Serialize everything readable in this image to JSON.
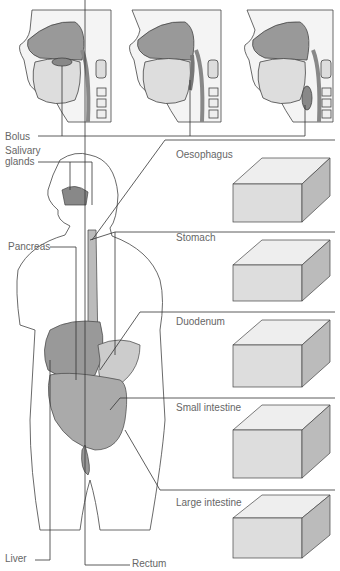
{
  "figure": {
    "top_panels": [
      "swallowing-stage-1",
      "swallowing-stage-2",
      "swallowing-stage-3"
    ],
    "labels": {
      "bolus": "Bolus",
      "salivary_1": "Salivary",
      "salivary_2": "glands",
      "pancreas": "Pancreas",
      "liver": "Liver",
      "rectum": "Rectum",
      "oesophagus": "Oesophagus",
      "stomach": "Stomach",
      "duodenum": "Duodenum",
      "small_intestine": "Small intestine",
      "large_intestine": "Large intestine"
    },
    "colors": {
      "line": "#333333",
      "organ_fill": "#9a9a9a",
      "tissue_fill": "#d8d8d8",
      "outline": "#444444"
    }
  }
}
